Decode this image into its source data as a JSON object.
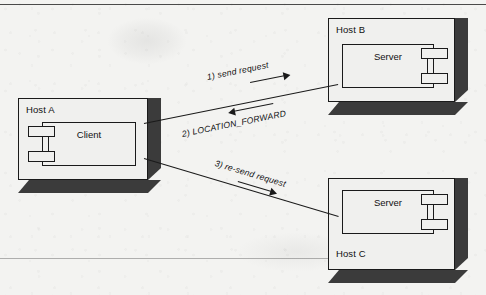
{
  "diagram": {
    "colors": {
      "background": "#f3f3f1",
      "node_face": "#f0f0ee",
      "node_shadow": "#3b3b3b",
      "stroke": "#1a1a1a",
      "frame_line": "#4a4a4a"
    },
    "nodes": [
      {
        "id": "host-a",
        "label": "Host A",
        "label_position": "top-left",
        "component": {
          "name": "Client",
          "port_side": "left",
          "port_count": 2
        }
      },
      {
        "id": "host-b",
        "label": "Host B",
        "label_position": "top-left",
        "component": {
          "name": "Server",
          "port_side": "right",
          "port_count": 2
        }
      },
      {
        "id": "host-c",
        "label": "Host C",
        "label_position": "bottom-left",
        "component": {
          "name": "Server",
          "port_side": "right",
          "port_count": 2
        }
      }
    ],
    "connections": [
      {
        "id": "conn-a-b",
        "from": "host-a",
        "to": "host-b",
        "labels": [
          {
            "id": "label-1",
            "text": "1) send request",
            "direction": "right"
          },
          {
            "id": "label-2",
            "text": "2) LOCATION_FORWARD",
            "direction": "left"
          }
        ]
      },
      {
        "id": "conn-a-c",
        "from": "host-a",
        "to": "host-c",
        "labels": [
          {
            "id": "label-3",
            "text": "3) re-send request",
            "direction": "right"
          }
        ]
      }
    ]
  }
}
